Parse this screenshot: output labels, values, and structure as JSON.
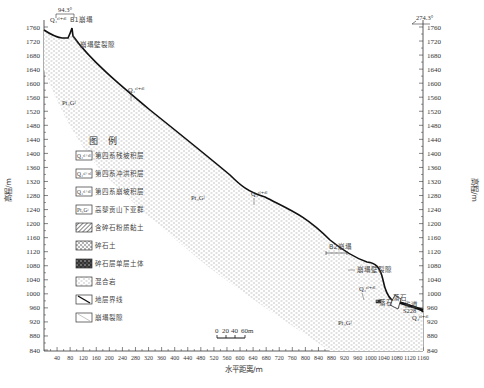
{
  "diagram": {
    "type": "geological-cross-section",
    "y_axis": {
      "title": "高程/m",
      "min": 840,
      "max": 1760,
      "step": 40,
      "ticks": [
        1760,
        1720,
        1680,
        1640,
        1600,
        1560,
        1520,
        1480,
        1440,
        1400,
        1360,
        1320,
        1280,
        1240,
        1200,
        1160,
        1120,
        1080,
        1040,
        1000,
        960,
        920,
        880,
        840
      ]
    },
    "x_axis": {
      "title": "水平距离/m",
      "min": 0,
      "max": 1160,
      "step": 40,
      "ticks": [
        40,
        80,
        120,
        160,
        200,
        240,
        280,
        320,
        360,
        400,
        440,
        480,
        520,
        560,
        600,
        640,
        680,
        720,
        760,
        800,
        840,
        880,
        920,
        960,
        1000,
        1040,
        1080,
        1120,
        1160
      ]
    },
    "orientation": {
      "left": "94.3°",
      "right": "274.3°"
    },
    "annotations": {
      "b1": "B1崩塌",
      "b1_wall": "崩塌壁裂隙",
      "b2": "B2崩塌",
      "b2_wall": "崩塌壁裂隙",
      "q_upper": "Q₄ᶜˡ⁺ᵈˡ",
      "q_mid": "Q₄ᶜˡ⁺ᵈˡ",
      "q_b1": "Q₄ᶜˡ⁺ᵈˡ",
      "q_lower": "Q₄ᶜˡ⁺ᵈˡ",
      "q_road": "Q₄ᶜˡ⁺ᵈˡ",
      "bedrock_upper": "Pt₃Gʲ",
      "bedrock_mid": "Pt₃Gʲ",
      "bedrock_lower": "Pt₃Gʲ",
      "rock1": "落石",
      "rock2": "落石",
      "road": "省道",
      "road_id": "S228"
    },
    "scale_bar": {
      "labels": [
        "0",
        "20",
        "40",
        "60m"
      ]
    },
    "legend": {
      "title": "图例",
      "items": [
        {
          "symbol": "Q₄ᶜˡ⁺ᵈˡ",
          "label": "第四系残坡积层"
        },
        {
          "symbol": "Q₄ᵃˡ⁺ᵖˡ",
          "label": "第四系冲洪积层"
        },
        {
          "symbol": "Q₄ᶜˡ⁺ᵈˡ",
          "label": "第四系崩坡积层"
        },
        {
          "symbol": "Pt₃Gʲ",
          "label": "高黎贡山下亚群"
        },
        {
          "symbol": "",
          "label": "含碎石粉质黏土"
        },
        {
          "symbol": "",
          "label": "碎石土"
        },
        {
          "symbol": "",
          "label": "碎石层单层土体"
        },
        {
          "symbol": "",
          "label": "混合岩"
        },
        {
          "symbol": "",
          "label": "地层界线"
        },
        {
          "symbol": "",
          "label": "崩塌裂隙"
        }
      ]
    },
    "caption": {
      "text": "",
      "note": "illegible in screenshot"
    }
  }
}
